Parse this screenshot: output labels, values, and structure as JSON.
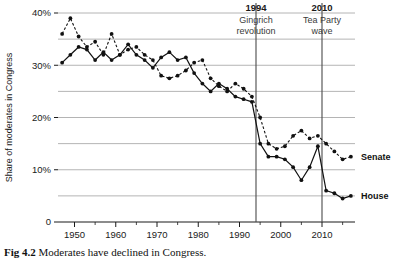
{
  "figure": {
    "caption_label": "Fig 4.2",
    "caption_text": "Moderates have declined in Congress."
  },
  "chart_data": {
    "type": "line",
    "title": "",
    "xlabel": "",
    "ylabel": "Share of moderates in Congress",
    "xlim": [
      1946,
      2018
    ],
    "ylim": [
      0,
      40
    ],
    "ytick_values": [
      0,
      10,
      20,
      30,
      40
    ],
    "ytick_labels": [
      "0",
      "10%",
      "20%",
      "30%",
      "40%"
    ],
    "gridline_values": [
      5,
      10,
      15,
      20,
      25,
      30,
      35,
      40
    ],
    "grid": true,
    "xtick_values": [
      1950,
      1960,
      1970,
      1980,
      1990,
      2000,
      2010
    ],
    "xtick_labels": [
      "1950",
      "1960",
      "1970",
      "1980",
      "1990",
      "2000",
      "2010"
    ],
    "xminor_values": [
      1955,
      1965,
      1975,
      1985,
      1995,
      2005,
      2015
    ],
    "legend_position": "right-inline",
    "series": [
      {
        "name": "Senate",
        "style": "dashed",
        "label_value": 12.5,
        "x": [
          1947,
          1949,
          1951,
          1953,
          1955,
          1957,
          1959,
          1961,
          1963,
          1965,
          1967,
          1969,
          1971,
          1973,
          1975,
          1977,
          1979,
          1981,
          1983,
          1985,
          1987,
          1989,
          1991,
          1993,
          1995,
          1997,
          1999,
          2001,
          2003,
          2005,
          2007,
          2009,
          2011,
          2013,
          2015,
          2017
        ],
        "values": [
          36.0,
          39.0,
          35.5,
          33.5,
          34.5,
          32.0,
          36.0,
          32.0,
          33.0,
          33.5,
          32.0,
          31.0,
          28.0,
          27.5,
          28.0,
          29.0,
          30.5,
          31.0,
          27.5,
          26.0,
          25.0,
          26.5,
          25.5,
          24.0,
          20.0,
          15.0,
          14.0,
          14.5,
          16.5,
          17.5,
          16.0,
          16.5,
          15.0,
          13.5,
          12.0,
          12.5
        ]
      },
      {
        "name": "House",
        "style": "solid",
        "label_value": 5.0,
        "x": [
          1947,
          1949,
          1951,
          1953,
          1955,
          1957,
          1959,
          1961,
          1963,
          1965,
          1967,
          1969,
          1971,
          1973,
          1975,
          1977,
          1979,
          1981,
          1983,
          1985,
          1987,
          1989,
          1991,
          1993,
          1995,
          1997,
          1999,
          2001,
          2003,
          2005,
          2007,
          2009,
          2011,
          2013,
          2015,
          2017
        ],
        "values": [
          30.5,
          32.0,
          33.5,
          33.0,
          31.0,
          32.5,
          31.0,
          32.0,
          34.0,
          32.0,
          31.0,
          29.5,
          31.5,
          32.5,
          31.0,
          31.5,
          28.5,
          26.5,
          25.0,
          26.5,
          25.5,
          24.0,
          23.5,
          23.0,
          15.0,
          12.5,
          12.5,
          12.0,
          10.5,
          8.0,
          10.5,
          14.5,
          6.0,
          5.5,
          4.5,
          5.0
        ]
      }
    ],
    "annotations": [
      {
        "year": 1994,
        "title": "1994",
        "line1": "Gingrich",
        "line2": "revolution"
      },
      {
        "year": 2010,
        "title": "2010",
        "line1": "Tea Party",
        "line2": "wave"
      }
    ]
  }
}
